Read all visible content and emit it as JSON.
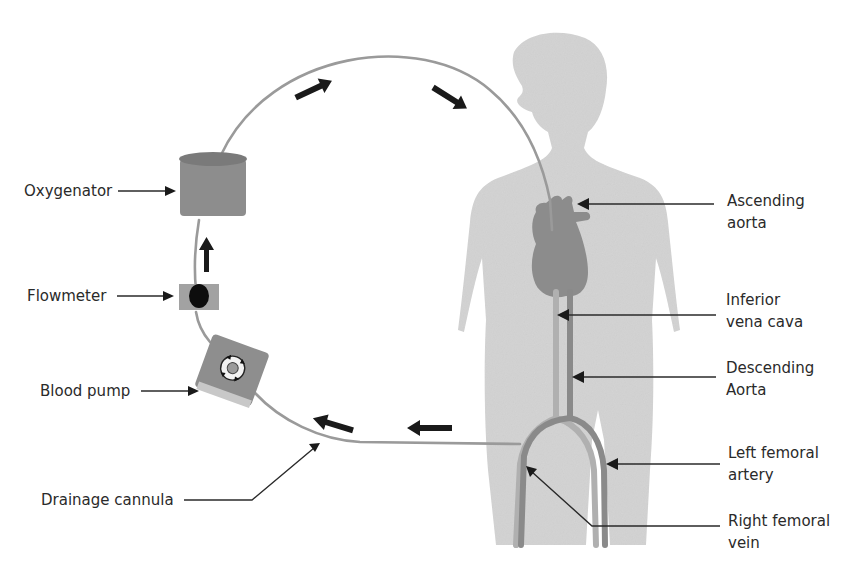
{
  "diagram": {
    "colors": {
      "body": "#d4d4d4",
      "vessel_dark": "#8a8a8a",
      "vessel_light": "#b0b0b0",
      "tubing": "#9a9a9a",
      "oxygenator": "#8d8d8d",
      "oxygenator_top": "#7a7a7a",
      "pump": "#8e8e8e",
      "flowmeter": "#a2a2a2",
      "heart": "#8c8c8c",
      "arrow": "#1a1a1a"
    },
    "labels": {
      "oxygenator": "Oxygenator",
      "flowmeter": "Flowmeter",
      "blood_pump": "Blood pump",
      "drainage_cannula": "Drainage cannula",
      "ascending_aorta": [
        "Ascending",
        "aorta"
      ],
      "inferior_vena_cava": [
        "Inferior",
        "vena cava"
      ],
      "descending_aorta": [
        "Descending",
        "Aorta"
      ],
      "left_femoral_artery": [
        "Left femoral",
        "artery"
      ],
      "right_femoral_vein": [
        "Right femoral",
        "vein"
      ]
    }
  }
}
